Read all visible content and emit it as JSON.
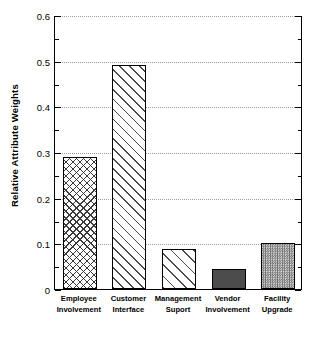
{
  "chart_data": {
    "type": "bar",
    "title": "",
    "xlabel": "",
    "ylabel": "Relative Attribute Weights",
    "ylim": [
      0,
      0.6
    ],
    "grid": true,
    "legend": "none",
    "categories": [
      "Employee Involvement",
      "Customer Interface",
      "Management Suport",
      "Vendor Involvement",
      "Facility Upgrade"
    ],
    "category_lines": [
      {
        "line1": "Employee",
        "line2": "Involvement"
      },
      {
        "line1": "Customer",
        "line2": "Interface"
      },
      {
        "line1": "Management",
        "line2": "Suport"
      },
      {
        "line1": "Vendor",
        "line2": "Involvement"
      },
      {
        "line1": "Facility",
        "line2": "Upgrade"
      }
    ],
    "values": [
      0.29,
      0.49,
      0.088,
      0.044,
      0.1
    ],
    "bar_fills": [
      "crosshatch",
      "diagonal-hatch",
      "diagonal-hatch-wide",
      "solid-dark-gray",
      "checkerboard-stipple"
    ],
    "y_ticks_major": [
      0,
      0.1,
      0.2,
      0.3,
      0.4,
      0.5,
      0.6
    ],
    "y_tick_labels": [
      "0",
      "0.1",
      "0.2",
      "0.3",
      "0.4",
      "0.5",
      "0.6"
    ],
    "y_ticks_minor": [
      0.05,
      0.15,
      0.25,
      0.35,
      0.45,
      0.55
    ],
    "colors": {
      "axis": "#000000",
      "gridline": "#9a9a9a",
      "background": "#ffffff",
      "bar_outline": "#000000",
      "solid_bar": "#4c4c4c",
      "stipple_bar": "#6e6e6e"
    }
  }
}
